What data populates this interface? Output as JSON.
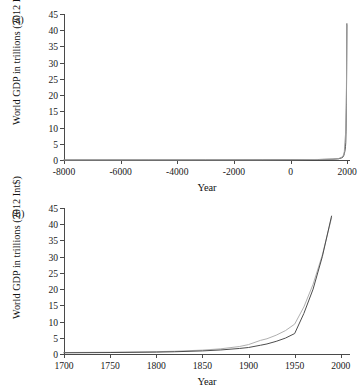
{
  "figure": {
    "axis_color": "#4a4a4a",
    "background": "#ffffff"
  },
  "panels": [
    {
      "tag": "(a)",
      "ylabel": "World GDP in trillions (2012 Int$)",
      "xlabel": "Year"
    },
    {
      "tag": "(b)",
      "ylabel": "World GDP in trillions (2012 Int$)",
      "xlabel": "Year"
    }
  ],
  "chart_data": [
    {
      "type": "line",
      "panel": "(a)",
      "title": "",
      "xlabel": "Year",
      "ylabel": "World GDP in trillions (2012 Int$)",
      "xlim": [
        -8000,
        2100
      ],
      "ylim": [
        0,
        45
      ],
      "xticks": [
        -8000,
        -6000,
        -4000,
        -2000,
        0,
        2000
      ],
      "xticklabels": [
        "-8000",
        "-6000",
        "-4000",
        "-2000",
        "0",
        "2000"
      ],
      "yticks": [
        0,
        5,
        10,
        15,
        20,
        25,
        30,
        35,
        40,
        45
      ],
      "yticklabels": [
        "0",
        "5",
        "10",
        "15",
        "20",
        "25",
        "30",
        "35",
        "40",
        "45"
      ],
      "grid": false,
      "legend": "none",
      "series": [
        {
          "name": "World GDP (long run)",
          "color": "#4d4d4d",
          "x": [
            -8000,
            -5000,
            -3000,
            -1000,
            0,
            1000,
            1500,
            1700,
            1820,
            1870,
            1900,
            1920,
            1940,
            1950,
            1960,
            1970,
            1980,
            1990
          ],
          "values": [
            0.0,
            0.01,
            0.02,
            0.05,
            0.1,
            0.15,
            0.25,
            0.37,
            0.7,
            1.1,
            1.98,
            2.7,
            4.1,
            5.3,
            8.9,
            16.0,
            25.0,
            42.0
          ]
        },
        {
          "name": "World GDP (alt series)",
          "color": "#9e9e9e",
          "x": [
            -8000,
            -1000,
            0,
            1000,
            1500,
            1700,
            1820,
            1870,
            1900,
            1950,
            1970,
            1990
          ],
          "values": [
            0.0,
            0.05,
            0.1,
            0.16,
            0.3,
            0.45,
            0.9,
            1.5,
            2.6,
            9.0,
            17.0,
            41.5
          ]
        }
      ]
    },
    {
      "type": "line",
      "panel": "(b)",
      "title": "",
      "xlabel": "Year",
      "ylabel": "World GDP in trillions (2012 Int$)",
      "xlim": [
        1700,
        2010
      ],
      "ylim": [
        0,
        45
      ],
      "xticks": [
        1700,
        1750,
        1800,
        1850,
        1900,
        1950,
        2000
      ],
      "xticklabels": [
        "1700",
        "1750",
        "1800",
        "1850",
        "1900",
        "1950",
        "2000"
      ],
      "yticks": [
        0,
        5,
        10,
        15,
        20,
        25,
        30,
        35,
        40,
        45
      ],
      "yticklabels": [
        "0",
        "5",
        "10",
        "15",
        "20",
        "25",
        "30",
        "35",
        "40",
        "45"
      ],
      "grid": false,
      "legend": "none",
      "series": [
        {
          "name": "World GDP (light series)",
          "color": "#b0b0b0",
          "x": [
            1700,
            1750,
            1800,
            1820,
            1850,
            1870,
            1890,
            1900,
            1913,
            1920,
            1930,
            1940,
            1950,
            1960,
            1970,
            1980,
            1990
          ],
          "values": [
            0.45,
            0.55,
            0.72,
            0.85,
            1.2,
            1.6,
            2.3,
            2.9,
            4.2,
            4.7,
            5.8,
            7.2,
            9.2,
            14.5,
            21.5,
            30.5,
            42.0
          ]
        },
        {
          "name": "World GDP (dark series)",
          "color": "#4d4d4d",
          "x": [
            1700,
            1750,
            1800,
            1820,
            1850,
            1870,
            1890,
            1900,
            1913,
            1920,
            1930,
            1940,
            1950,
            1960,
            1970,
            1980,
            1990
          ],
          "values": [
            0.37,
            0.45,
            0.58,
            0.69,
            0.95,
            1.25,
            1.7,
            2.0,
            2.7,
            3.1,
            3.9,
            4.9,
            6.3,
            12.5,
            20.0,
            30.0,
            42.5
          ]
        }
      ]
    }
  ]
}
